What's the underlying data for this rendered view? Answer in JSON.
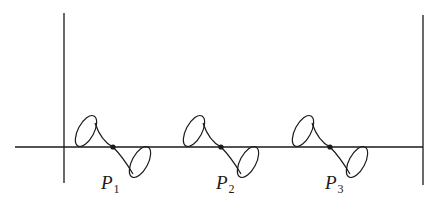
{
  "diagram": {
    "colors": {
      "stroke": "#1a1a1a",
      "background": "#ffffff"
    },
    "axis": {
      "y": 147,
      "x_start": 15,
      "x_end": 423
    },
    "walls": [
      {
        "name": "left-wall",
        "x": 64,
        "y_top": 13,
        "y_bottom": 183
      },
      {
        "name": "right-wall",
        "x": 423,
        "y_top": 15,
        "y_bottom": 185
      }
    ],
    "points": [
      {
        "id": "P1",
        "letter": "P",
        "subscript": "1",
        "x": 113,
        "y": 147,
        "label_x": 101,
        "label_y": 173
      },
      {
        "id": "P2",
        "letter": "P",
        "subscript": "2",
        "x": 221,
        "y": 147,
        "label_x": 216,
        "label_y": 173
      },
      {
        "id": "P3",
        "letter": "P",
        "subscript": "3",
        "x": 330,
        "y": 147,
        "label_x": 325,
        "label_y": 173
      }
    ]
  }
}
